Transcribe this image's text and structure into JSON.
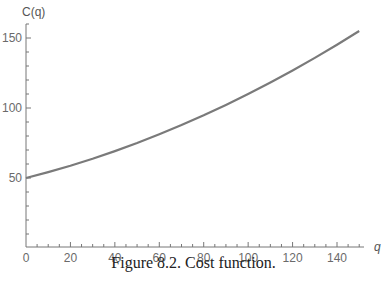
{
  "chart_data": {
    "type": "line",
    "title": "",
    "xlabel": "q",
    "ylabel": "C(q)",
    "xlim": [
      0,
      150
    ],
    "ylim": [
      0,
      160
    ],
    "x_ticks": [
      0,
      20,
      40,
      60,
      80,
      100,
      120,
      140
    ],
    "y_ticks": [
      50,
      100,
      150
    ],
    "grid": false,
    "legend": null,
    "series": [
      {
        "name": "C(q)",
        "color": "#7a7a7a",
        "x": [
          0,
          10,
          20,
          30,
          40,
          50,
          60,
          70,
          80,
          90,
          100,
          110,
          120,
          130,
          140,
          150
        ],
        "y": [
          50,
          54.2,
          58.8,
          63.8,
          69.2,
          75,
          81.2,
          87.8,
          94.8,
          102.2,
          110,
          118.2,
          126.8,
          135.8,
          145.2,
          155
        ]
      }
    ]
  },
  "caption": "Figure 8.2.  Cost function.",
  "labels": {
    "y_axis": "C(q)",
    "x_axis": "q",
    "x_ticks": [
      "0",
      "20",
      "40",
      "60",
      "80",
      "100",
      "120",
      "140"
    ],
    "y_ticks": [
      "50",
      "100",
      "150"
    ]
  }
}
